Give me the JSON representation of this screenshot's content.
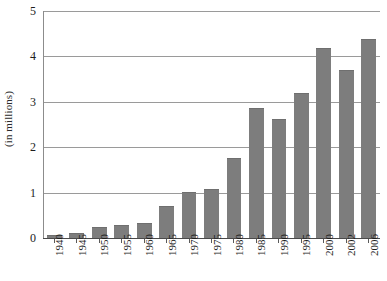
{
  "chart_data": {
    "type": "bar",
    "title": "",
    "xlabel": "",
    "ylabel": "(in millions)",
    "ylim": [
      0,
      5
    ],
    "yticks": [
      0,
      1,
      2,
      3,
      4,
      5
    ],
    "ytick_labels": [
      "0",
      "1",
      "2",
      "3",
      "4",
      "5"
    ],
    "grid": true,
    "legend": "none",
    "bar_color": "#7d7d7d",
    "gridline_color": "#9a9a9a",
    "axis_color": "#4a4a4a",
    "categories": [
      "1940",
      "1945",
      "1950",
      "1955",
      "1960",
      "1965",
      "1970",
      "1975",
      "1980",
      "1985",
      "1990",
      "1995",
      "2000",
      "2002",
      "2006"
    ],
    "values": [
      0.07,
      0.1,
      0.25,
      0.28,
      0.33,
      0.7,
      1.02,
      1.07,
      1.77,
      2.86,
      2.63,
      3.2,
      4.18,
      3.69,
      4.38
    ]
  }
}
